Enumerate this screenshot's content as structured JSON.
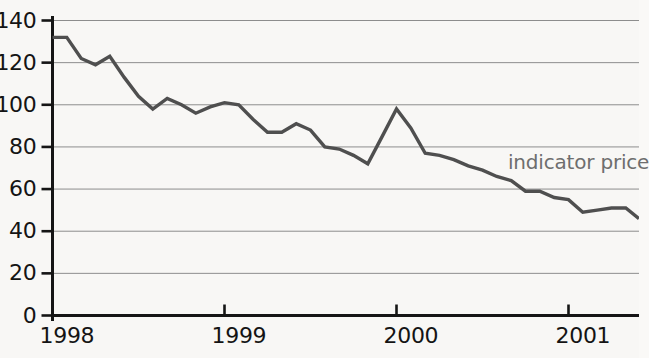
{
  "chart_data": {
    "type": "line",
    "title": "",
    "xlabel": "",
    "ylabel": "",
    "grid": true,
    "legend_position": "inline-right",
    "ylim": [
      0,
      140
    ],
    "yticks": [
      0,
      20,
      40,
      60,
      80,
      100,
      120,
      140
    ],
    "ytick_labels": [
      "0",
      "20",
      "40",
      "60",
      "80",
      "100",
      "120",
      "140"
    ],
    "xtick_labels": [
      "1998",
      "1999",
      "2000",
      "2001"
    ],
    "xtick_values": [
      1998,
      1999,
      2000,
      2001
    ],
    "xlim": [
      1998,
      2001.41
    ],
    "series": [
      {
        "name": "indicator price",
        "color": "#4f4f4f",
        "annotation": "indicator price",
        "x": [
          1998.0,
          1998.083,
          1998.167,
          1998.25,
          1998.333,
          1998.417,
          1998.5,
          1998.583,
          1998.667,
          1998.75,
          1998.833,
          1998.917,
          1999.0,
          1999.083,
          1999.167,
          1999.25,
          1999.333,
          1999.417,
          1999.5,
          1999.583,
          1999.667,
          1999.75,
          1999.833,
          1999.917,
          2000.0,
          2000.083,
          2000.167,
          2000.25,
          2000.333,
          2000.417,
          2000.5,
          2000.583,
          2000.667,
          2000.75,
          2000.833,
          2000.917,
          2001.0,
          2001.083,
          2001.167,
          2001.25,
          2001.333,
          2001.41
        ],
        "values": [
          132,
          132,
          122,
          119,
          123,
          113,
          104,
          98,
          103,
          100,
          96,
          99,
          101,
          100,
          93,
          87,
          87,
          91,
          88,
          80,
          79,
          76,
          72,
          85,
          98,
          89,
          77,
          76,
          74,
          71,
          69,
          66,
          64,
          59,
          59,
          56,
          55,
          49,
          50,
          51,
          51,
          46
        ]
      }
    ]
  },
  "annotations": {
    "series_label": "indicator price"
  },
  "colors": {
    "line": "#4f4f4f",
    "grid": "#8d8d8d",
    "axis": "#151515",
    "background": "#f8f7f5",
    "tick_text": "#141414",
    "annotation_text": "#6e6e6e"
  }
}
